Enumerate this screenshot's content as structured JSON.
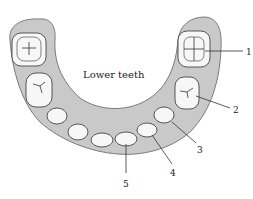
{
  "diagram": {
    "title": "Lower teeth",
    "callouts": [
      {
        "number": "1",
        "target": "molar (upper right)"
      },
      {
        "number": "2",
        "target": "premolar"
      },
      {
        "number": "3",
        "target": "premolar"
      },
      {
        "number": "4",
        "target": "canine"
      },
      {
        "number": "5",
        "target": "incisor"
      }
    ],
    "colors": {
      "gum": "#c9c9c9",
      "gum_edge": "#7a7a7a",
      "tooth": "#f7f7f7",
      "outline": "#333333",
      "text": "#222222"
    }
  }
}
